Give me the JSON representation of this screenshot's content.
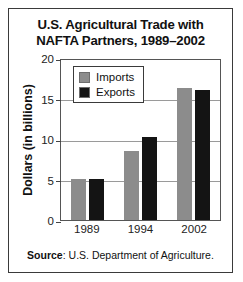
{
  "chart_data": {
    "type": "bar",
    "title": "U.S. Agricultural Trade with NAFTA Partners, 1989–2002",
    "title_line1": "U.S. Agricultural Trade with",
    "title_line2": "NAFTA Partners, 1989–2002",
    "xlabel": "",
    "ylabel": "Dollars (in billions)",
    "categories": [
      "1989",
      "1994",
      "2002"
    ],
    "series": [
      {
        "name": "Imports",
        "color": "#8c8c8c",
        "values": [
          5.1,
          8.5,
          16.3
        ]
      },
      {
        "name": "Exports",
        "color": "#141414",
        "values": [
          5.1,
          10.3,
          16.0
        ]
      }
    ],
    "ylim": [
      0,
      20
    ],
    "yticks": [
      0,
      5,
      10,
      15,
      20
    ],
    "ytick_labels": [
      "0",
      "5",
      "10",
      "15",
      "20"
    ],
    "grid": true,
    "legend_position": "upper left",
    "source_prefix": "Source",
    "source_text": ": U.S. Department of Agriculture."
  }
}
